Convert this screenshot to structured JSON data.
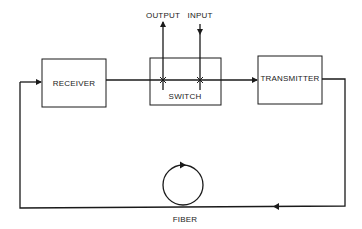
{
  "diagram": {
    "blocks": {
      "receiver": "RECEIVER",
      "switch": "SWITCH",
      "transmitter": "TRANSMITTER"
    },
    "ports": {
      "output": "OUTPUT",
      "input": "INPUT"
    },
    "fiber_label": "FIBER",
    "colors": {
      "line": "#1a1a1a",
      "background": "#ffffff"
    }
  }
}
